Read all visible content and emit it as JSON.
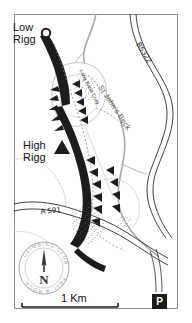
{
  "figure": {
    "kind": "topographic-climbing-map",
    "area": "High Rigg / Low Rigg, Lake District",
    "background_color": "#ffffff",
    "border_color": "#888888",
    "ink_color": "#111111"
  },
  "labels": {
    "low_rigg": "Low\nRigg",
    "low_rigg_line1": "Low",
    "low_rigg_line2": "Rigg",
    "high_rigg_line1": "High",
    "high_rigg_line2": "Rigg",
    "road_a591": "A 591",
    "road_b5322": "B5322",
    "water_st_johns_beck": "St John's Beck",
    "crag_label_upper": "Long Band Crag"
  },
  "scale_bar": {
    "label": "1 Km",
    "length_px": 96
  },
  "markers": {
    "parking": {
      "name": "parking-marker",
      "glyph": "P",
      "fill": "#1a1a1a",
      "text_color": "#ffffff"
    },
    "low_rigg_summit": {
      "name": "summit-circle-marker",
      "shape": "circle"
    },
    "high_rigg_summit": {
      "name": "summit-triangle-marker",
      "shape": "triangle"
    }
  },
  "compass_logo": {
    "club_name_top": "CLIMBING CLUB",
    "club_name_bottom": "FELL & ROCK",
    "north_letter": "N",
    "outline_color": "#999999",
    "text_color": "#9a9a9a"
  },
  "legend_features": [
    "crag-tick-symbols",
    "scree-stipple",
    "footpath-dashed",
    "road-double-line",
    "stream-grey-line"
  ]
}
